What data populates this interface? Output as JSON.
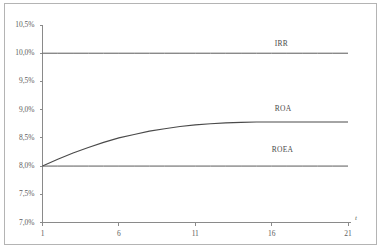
{
  "chart_data": {
    "type": "line",
    "title": "",
    "xlabel": "t",
    "ylabel": "",
    "xlim": [
      1,
      21
    ],
    "ylim": [
      7.0,
      10.5
    ],
    "grid": false,
    "legend_position": "inline-right",
    "x_ticks": [
      "1",
      "6",
      "11",
      "16",
      "21"
    ],
    "x_tick_values": [
      1,
      6,
      11,
      16,
      21
    ],
    "y_ticks": [
      "7,0%",
      "7,5%",
      "8,0%",
      "8,5%",
      "9,0%",
      "9,5%",
      "10,0%",
      "10,5%"
    ],
    "y_tick_values": [
      7.0,
      7.5,
      8.0,
      8.5,
      9.0,
      9.5,
      10.0,
      10.5
    ],
    "x": [
      1,
      2,
      3,
      4,
      5,
      6,
      7,
      8,
      9,
      10,
      11,
      12,
      13,
      14,
      15,
      16,
      17,
      18,
      19,
      20,
      21
    ],
    "series": [
      {
        "name": "IRR",
        "values": [
          10.0,
          10.0,
          10.0,
          10.0,
          10.0,
          10.0,
          10.0,
          10.0,
          10.0,
          10.0,
          10.0,
          10.0,
          10.0,
          10.0,
          10.0,
          10.0,
          10.0,
          10.0,
          10.0,
          10.0,
          10.0
        ]
      },
      {
        "name": "ROA",
        "values": [
          8.0,
          8.12,
          8.23,
          8.33,
          8.42,
          8.5,
          8.56,
          8.62,
          8.66,
          8.7,
          8.73,
          8.75,
          8.765,
          8.775,
          8.78,
          8.78,
          8.78,
          8.78,
          8.78,
          8.78,
          8.78
        ]
      },
      {
        "name": "ROEA",
        "values": [
          8.0,
          8.0,
          8.0,
          8.0,
          8.0,
          8.0,
          8.0,
          8.0,
          8.0,
          8.0,
          8.0,
          8.0,
          8.0,
          8.0,
          8.0,
          8.0,
          8.0,
          8.0,
          8.0,
          8.0,
          8.0
        ]
      }
    ],
    "annotations": [
      {
        "text": "IRR",
        "x": 16.2,
        "y": 10.17
      },
      {
        "text": "ROA",
        "x": 16.2,
        "y": 9.02
      },
      {
        "text": "ROEA",
        "x": 16.0,
        "y": 8.28
      }
    ],
    "colors": {
      "line": "#5a5a5a",
      "axis": "#8a8a8a",
      "text": "#5d5d5d",
      "frame": "#b4b4b4",
      "background": "#ffffff"
    }
  }
}
